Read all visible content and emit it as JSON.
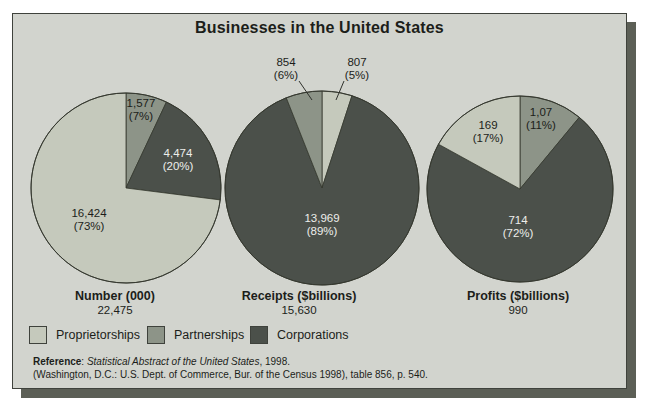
{
  "title": "Businesses in the United States",
  "palette": {
    "proprietorships": "#c5c9bc",
    "partnerships": "#8d9488",
    "corporations": "#4b504a",
    "panel_bg": "#d2d4ce",
    "panel_border": "#3f423c",
    "shadow": "#5c5f56",
    "pie_outline": "#35382f",
    "text_dark": "#1c1e1a",
    "text_light": "#edeeea"
  },
  "legend": [
    {
      "label": "Proprietorships",
      "color_key": "proprietorships"
    },
    {
      "label": "Partnerships",
      "color_key": "partnerships"
    },
    {
      "label": "Corporations",
      "color_key": "corporations"
    }
  ],
  "reference": {
    "label": "Reference",
    "colon": ":  ",
    "italic": "Statistical Abstract of the United States",
    "suffix": ", 1998.",
    "line2": "(Washington, D.C.: U.S. Dept. of Commerce, Bur. of the Census 1998), table 856, p. 540."
  },
  "chart_data": [
    {
      "type": "pie",
      "caption": "Number (000)",
      "total": "22,475",
      "slices": [
        {
          "name": "Partnerships",
          "value": 1577,
          "pct": 7,
          "label_value": "1,577",
          "label_pct": "(7%)",
          "color_key": "partnerships",
          "text": "dark"
        },
        {
          "name": "Corporations",
          "value": 4474,
          "pct": 20,
          "label_value": "4,474",
          "label_pct": "(20%)",
          "color_key": "corporations",
          "text": "light"
        },
        {
          "name": "Proprietorships",
          "value": 16424,
          "pct": 73,
          "label_value": "16,424",
          "label_pct": "(73%)",
          "color_key": "proprietorships",
          "text": "dark"
        }
      ]
    },
    {
      "type": "pie",
      "caption": "Receipts ($billions)",
      "total": "15,630",
      "slices": [
        {
          "name": "Proprietorships",
          "value": 807,
          "pct": 5,
          "label_value": "807",
          "label_pct": "(5%)",
          "color_key": "proprietorships",
          "text": "dark"
        },
        {
          "name": "Corporations",
          "value": 13969,
          "pct": 89,
          "label_value": "13,969",
          "label_pct": "(89%)",
          "color_key": "corporations",
          "text": "light"
        },
        {
          "name": "Partnerships",
          "value": 854,
          "pct": 6,
          "label_value": "854",
          "label_pct": "(6%)",
          "color_key": "partnerships",
          "text": "dark"
        }
      ]
    },
    {
      "type": "pie",
      "caption": "Profits ($billions)",
      "total": "990",
      "slices": [
        {
          "name": "Partnerships",
          "value": 107,
          "pct": 11,
          "label_value": "1,07",
          "label_pct": "(11%)",
          "color_key": "partnerships",
          "text": "dark"
        },
        {
          "name": "Corporations",
          "value": 714,
          "pct": 72,
          "label_value": "714",
          "label_pct": "(72%)",
          "color_key": "corporations",
          "text": "light"
        },
        {
          "name": "Proprietorships",
          "value": 169,
          "pct": 17,
          "label_value": "169",
          "label_pct": "(17%)",
          "color_key": "proprietorships",
          "text": "dark"
        }
      ]
    }
  ]
}
